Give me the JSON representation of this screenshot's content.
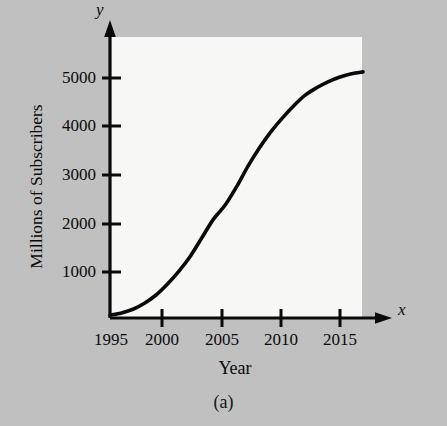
{
  "figure": {
    "caption": "(a)",
    "background_color": "#c0c0c0",
    "panel_color": "#f7f7f5",
    "ink_color": "#0a0a0a"
  },
  "axis_letters": {
    "x": "x",
    "y": "y"
  },
  "chart_data": {
    "type": "line",
    "title": "",
    "subtitle": "",
    "xlabel": "Year",
    "ylabel": "Millions of Subscribers",
    "xlim": [
      1995,
      2017.5
    ],
    "ylim": [
      0,
      5900
    ],
    "grid": false,
    "legend": null,
    "xticks": [
      1995,
      2000,
      2005,
      2010,
      2015
    ],
    "xticklabels": [
      "1995",
      "2000",
      "2005",
      "2010",
      "2015"
    ],
    "yticks": [
      1000,
      2000,
      3000,
      4000,
      5000
    ],
    "yticklabels": [
      "1000",
      "2000",
      "3000",
      "4000",
      "5000"
    ],
    "series": [
      {
        "name": "Mobile cellular subscribers",
        "x": [
          1995,
          1996,
          1997,
          1998,
          1999,
          2000,
          2001,
          2002,
          2003,
          2004,
          2005,
          2006,
          2007,
          2008,
          2009,
          2010,
          2011,
          2012,
          2013,
          2014,
          2015,
          2016,
          2017
        ],
        "values": [
          60,
          110,
          190,
          320,
          500,
          740,
          1020,
          1350,
          1750,
          2150,
          2450,
          2850,
          3300,
          3700,
          4050,
          4350,
          4620,
          4850,
          5010,
          5140,
          5240,
          5310,
          5350
        ]
      }
    ],
    "annotations": []
  }
}
